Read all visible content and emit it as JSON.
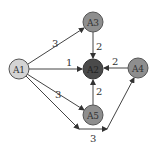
{
  "diagram": {
    "nodes": [
      {
        "id": "A1",
        "label": "A1",
        "x": 19,
        "y": 69,
        "fill": "#d4d4d4"
      },
      {
        "id": "A3",
        "label": "A3",
        "x": 93,
        "y": 22,
        "fill": "#8e8e8e"
      },
      {
        "id": "A2",
        "label": "A2",
        "x": 93,
        "y": 69,
        "fill": "#4a4a4a"
      },
      {
        "id": "A4",
        "label": "A4",
        "x": 138,
        "y": 68,
        "fill": "#8e8e8e"
      },
      {
        "id": "A5",
        "label": "A5",
        "x": 93,
        "y": 115,
        "fill": "#8e8e8e"
      }
    ],
    "edges": [
      {
        "from": "A1",
        "to": "A3",
        "weight": "3"
      },
      {
        "from": "A1",
        "to": "A2",
        "weight": "1"
      },
      {
        "from": "A1",
        "to": "A5",
        "weight": "3"
      },
      {
        "from": "A3",
        "to": "A2",
        "weight": "2"
      },
      {
        "from": "A4",
        "to": "A2",
        "weight": "2"
      },
      {
        "from": "A5",
        "to": "A2",
        "weight": "2"
      },
      {
        "from": "A1",
        "to": "A4",
        "weight": "3",
        "via": "bottom-path"
      }
    ]
  }
}
